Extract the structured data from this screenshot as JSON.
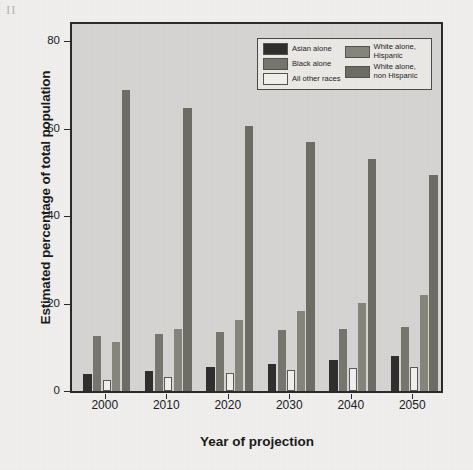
{
  "page": {
    "scan_mark": "II",
    "background_color": "#f1f0ee"
  },
  "chart_data": {
    "type": "bar",
    "title": "",
    "xlabel": "Year of projection",
    "ylabel": "Estimated percentage of total population",
    "categories": [
      "2000",
      "2010",
      "2020",
      "2030",
      "2040",
      "2050"
    ],
    "ylim": [
      0,
      84
    ],
    "yticks": [
      0,
      20,
      40,
      60,
      80
    ],
    "ytick_labels": [
      "0",
      "20",
      "40",
      "60",
      "80"
    ],
    "grid": false,
    "legend_position": "top-right",
    "plot_background_color": "#d6d5d3",
    "series": [
      {
        "name": "Asian alone",
        "color": "#2f2f2f",
        "values": [
          3.8,
          4.6,
          5.4,
          6.2,
          7.1,
          8.0
        ]
      },
      {
        "name": "Black alone",
        "color": "#77776f",
        "values": [
          12.7,
          13.1,
          13.5,
          13.9,
          14.3,
          14.6
        ]
      },
      {
        "name": "All other races",
        "color": "#f2f1ee",
        "values": [
          2.6,
          3.2,
          4.1,
          4.7,
          5.3,
          5.6
        ]
      },
      {
        "name": "White alone,\nHispanic",
        "color": "#86867d",
        "values": [
          11.3,
          14.3,
          16.3,
          18.2,
          20.1,
          22.0
        ]
      },
      {
        "name": "White alone,\nnon Hispanic",
        "color": "#6e6e67",
        "values": [
          69.0,
          64.7,
          60.7,
          56.9,
          53.0,
          49.4
        ]
      }
    ]
  },
  "legend": {
    "column_left": [
      "Asian alone",
      "Black alone",
      "All other races"
    ],
    "column_right": [
      "White alone,\nHispanic",
      "White alone,\nnon Hispanic"
    ]
  }
}
